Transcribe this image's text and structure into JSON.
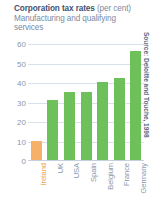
{
  "chart_data": {
    "type": "bar",
    "title": "Corporation tax rates (per cent)",
    "title_main": "Corporation tax rates",
    "title_unit": "(per cent)",
    "subtitle_line1": "Manufacturing and qualifying",
    "subtitle_line2": "services",
    "xlabel": "",
    "ylabel": "",
    "categories": [
      "Ireland",
      "UK",
      "USA",
      "Spain",
      "Belgium",
      "France",
      "Germany"
    ],
    "values": [
      10,
      31,
      35,
      35,
      40,
      42,
      56
    ],
    "ylim": [
      0,
      60
    ],
    "yticks": [
      0,
      10,
      20,
      30,
      40,
      50,
      60
    ],
    "ytick_labels": [
      "0",
      "10",
      "20",
      "30",
      "40",
      "50",
      "60"
    ],
    "grid": true,
    "legend": "none",
    "highlight_index": 0,
    "colors": {
      "bar": "#6dc05a",
      "bar_highlight": "#f5b06a",
      "grid": "#d9e2ec",
      "title": "#3f5270",
      "subtitle": "#7b8aa3",
      "tick_label": "#8b98ad",
      "highlight_label": "#f0a24f",
      "background": "#ffffff"
    },
    "source": "Source: Deloitte and Touche, 1998"
  }
}
